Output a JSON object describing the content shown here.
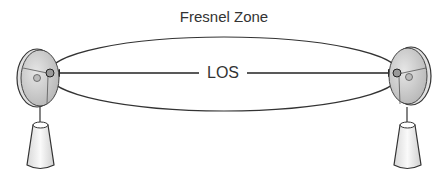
{
  "diagram": {
    "title": "Fresnel Zone",
    "los_label": "LOS",
    "elements": [
      {
        "name": "left-antenna",
        "type": "dish-on-pedestal"
      },
      {
        "name": "right-antenna",
        "type": "dish-on-pedestal"
      },
      {
        "name": "fresnel-ellipse",
        "type": "ellipse"
      },
      {
        "name": "los-line",
        "type": "double-arrow"
      }
    ],
    "colors": {
      "line": "#333333",
      "dish": "#cfcfcf",
      "pedestal": "#f2f2f2"
    }
  }
}
